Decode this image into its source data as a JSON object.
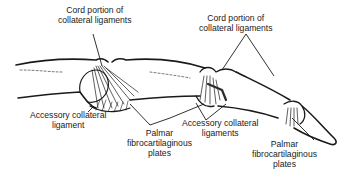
{
  "figure": {
    "labels": {
      "cord_left": [
        "Cord portion of",
        "collateral ligaments"
      ],
      "cord_right": [
        "Cord portion of",
        "collateral ligaments"
      ],
      "accessory_left": [
        "Accessory collateral",
        "ligament"
      ],
      "palmar_left": [
        "Palmar",
        "fibrocartilaginous",
        "plates"
      ],
      "accessory_right": [
        "Accessory collateral",
        "ligaments"
      ],
      "palmar_right": [
        "Palmar",
        "fibrocartilaginous",
        "plates"
      ]
    },
    "colors": {
      "ink": "#1a1a1a",
      "background": "#ffffff"
    }
  }
}
